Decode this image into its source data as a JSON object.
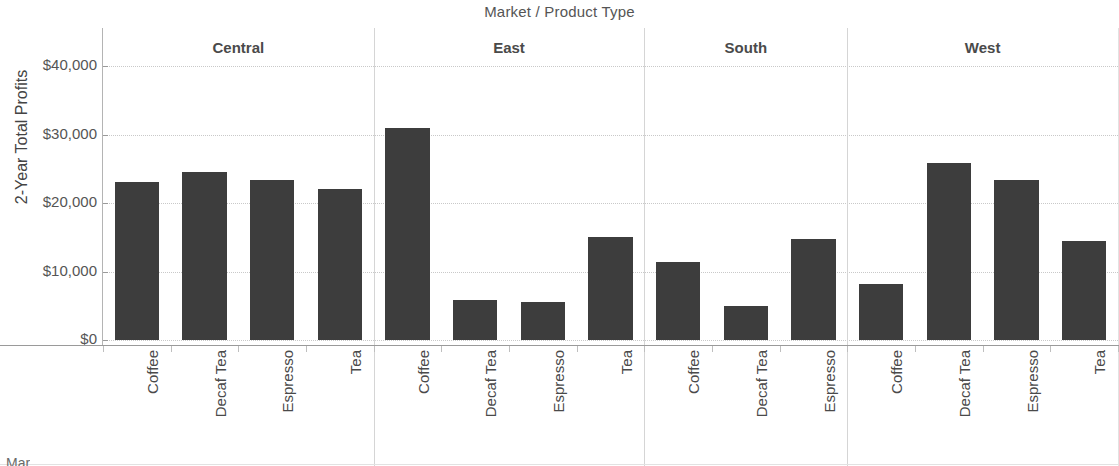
{
  "chart_data": {
    "type": "bar",
    "title": "Market / Product Type",
    "xlabel": "Market / Product Type",
    "ylabel": "2-Year Total Profits",
    "ylim": [
      0,
      40000
    ],
    "y_ticks": [
      0,
      10000,
      20000,
      30000,
      40000
    ],
    "y_tick_labels": [
      "$0",
      "$10,000",
      "$20,000",
      "$30,000",
      "$40,000"
    ],
    "grid": "horizontal-dotted",
    "legend": "none",
    "bar_color": "#3d3d3d",
    "panels": [
      {
        "name": "Central",
        "categories": [
          "Coffee",
          "Decaf Tea",
          "Espresso",
          "Tea"
        ],
        "values": [
          23000,
          24600,
          23300,
          22100
        ]
      },
      {
        "name": "East",
        "categories": [
          "Coffee",
          "Decaf Tea",
          "Espresso",
          "Tea"
        ],
        "values": [
          31000,
          5900,
          5500,
          15100
        ]
      },
      {
        "name": "South",
        "categories": [
          "Coffee",
          "Decaf Tea",
          "Espresso"
        ],
        "values": [
          11400,
          4900,
          14700
        ]
      },
      {
        "name": "West",
        "categories": [
          "Coffee",
          "Decaf Tea",
          "Espresso",
          "Tea"
        ],
        "values": [
          8200,
          25800,
          23300,
          14500
        ]
      }
    ]
  },
  "footer": {
    "fragment": "Mar"
  }
}
